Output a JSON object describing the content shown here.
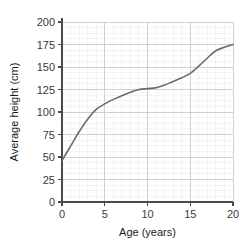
{
  "chart_data": {
    "type": "line",
    "title": "",
    "xlabel": "Age (years)",
    "ylabel": "Average height (cm)",
    "xlim": [
      0,
      20
    ],
    "ylim": [
      0,
      200
    ],
    "xticks": [
      0,
      5,
      10,
      15,
      20
    ],
    "yticks": [
      0,
      25,
      50,
      75,
      100,
      125,
      150,
      175,
      200
    ],
    "xtick_labels": [
      "0",
      "5",
      "10",
      "15",
      "20"
    ],
    "ytick_labels": [
      "0",
      "25",
      "50",
      "75",
      "100",
      "125",
      "150",
      "175",
      "200"
    ],
    "grid": true,
    "grid_major_color": "#c9ccd1",
    "grid_minor_color": "#eceef0",
    "grid_minor_x_step": 1,
    "grid_minor_y_step": 6.25,
    "legend": null,
    "axis_color": "#4a4a4a",
    "line_color": "#6b6b6b",
    "line_width": 1.6,
    "series": [
      {
        "name": "Average height",
        "x": [
          0,
          1,
          2,
          3,
          4,
          5,
          6,
          7,
          8,
          9,
          10,
          11,
          12,
          13,
          14,
          15,
          16,
          17,
          18,
          19,
          20
        ],
        "values": [
          46,
          62,
          78,
          92,
          103,
          109,
          114,
          118,
          122,
          125,
          126,
          127,
          130,
          134,
          138,
          143,
          151,
          160,
          168,
          172,
          175
        ]
      }
    ]
  }
}
